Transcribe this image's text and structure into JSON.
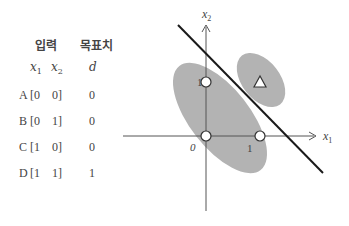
{
  "table": {
    "header_input": "입력",
    "header_target": "목표치",
    "sub_x1": "x",
    "sub_x1_idx": "1",
    "sub_x2": "x",
    "sub_x2_idx": "2",
    "sub_d": "d",
    "rows": [
      {
        "label": "A",
        "x1": "[0",
        "x2": "0]",
        "d": "0"
      },
      {
        "label": "B",
        "x1": "[0",
        "x2": "1]",
        "d": "0"
      },
      {
        "label": "C",
        "x1": "[1",
        "x2": "0]",
        "d": "0"
      },
      {
        "label": "D",
        "x1": "[1",
        "x2": "1]",
        "d": "1"
      }
    ]
  },
  "plot": {
    "x_axis_label": "x",
    "x_axis_idx": "1",
    "y_axis_label": "x",
    "y_axis_idx": "2",
    "tick_x1": "1",
    "tick_y1": "1",
    "origin": "0",
    "colors": {
      "region": "#b3b3b3",
      "line": "#1a1a1a",
      "axis": "#555555"
    }
  }
}
